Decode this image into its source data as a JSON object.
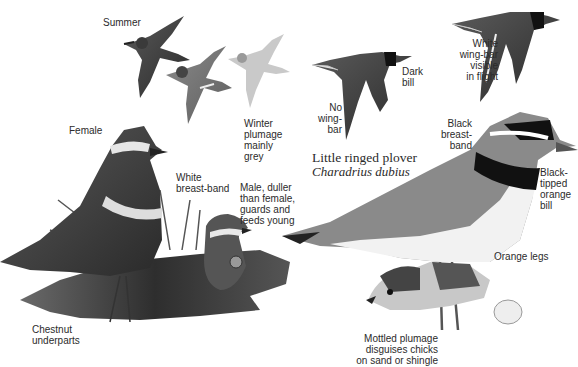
{
  "species": {
    "common_name": "Little ringed plover",
    "latin_name": "Charadrius dubius"
  },
  "labels": {
    "summer": "Summer",
    "winter": "Winter\nplumage\nmainly\ngrey",
    "no_wing_bar": "No\nwing-\nbar",
    "dark_bill": "Dark\nbill",
    "white_wing_bar": "White\nwing-bar\nvisible\nin flight",
    "black_breast_band": "Black\nbreast-\nband",
    "black_tipped_bill": "Black-\ntipped\norange\nbill",
    "orange_legs": "Orange legs",
    "mottled_plumage": "Mottled plumage\ndisguises chicks\non sand or shingle",
    "female": "Female",
    "white_breast_band": "White\nbreast-band",
    "male": "Male, duller\nthan female,\nguards and\nfeeds young",
    "chestnut_underparts": "Chestnut\nunderparts"
  },
  "illustrations": [
    {
      "id": "flying-summer-1",
      "subject": "plover in flight, summer plumage"
    },
    {
      "id": "flying-summer-2",
      "subject": "plover in flight, summer plumage"
    },
    {
      "id": "flying-winter",
      "subject": "plover in flight, winter plumage"
    },
    {
      "id": "flying-little-ringed",
      "subject": "little ringed plover in flight"
    },
    {
      "id": "flying-ringed",
      "subject": "ringed plover in flight with wing-bar"
    },
    {
      "id": "female-dotterel",
      "subject": "female standing on grass"
    },
    {
      "id": "male-dotterel",
      "subject": "male sitting in nest"
    },
    {
      "id": "little-ringed-plover-adult",
      "subject": "adult standing"
    },
    {
      "id": "chick",
      "subject": "mottled chick"
    }
  ]
}
